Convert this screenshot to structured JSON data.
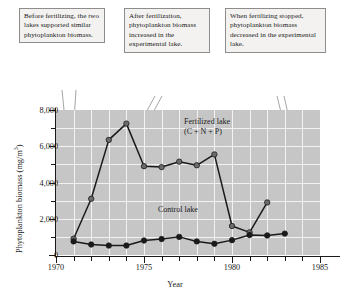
{
  "figure": {
    "callouts": [
      {
        "id": "callout-before",
        "text": "Before fertilizing, the two lakes supported similar phytoplankton biomass."
      },
      {
        "id": "callout-after",
        "text": "After fertilization, phytoplankton biomass increased in the experimental lake."
      },
      {
        "id": "callout-stopped",
        "text": "When fertilizing stopped, phytoplankton biomass decreased in the experimental lake."
      }
    ],
    "colors": {
      "plot_background": "#c6c6c6",
      "gridline": "#f2f2f2",
      "axis": "#1a1a1a",
      "fertilized_marker": "#6b6b6b",
      "control_marker": "#1a1a1a",
      "callout_background": "#f3f2f0",
      "callout_border": "#8d8d8d",
      "leader_line": "#8d8d8d"
    }
  },
  "chart_data": {
    "type": "line",
    "title": "",
    "xlabel": "Year",
    "ylabel": "Phytoplankton biomass (mg/m3)",
    "ylabel_parts": {
      "text": "Phytoplankton biomass (mg/m",
      "superscript": "3",
      "tail": ")"
    },
    "xlim": [
      1970,
      1985
    ],
    "ylim": [
      0,
      8000
    ],
    "grid": true,
    "legend_position": "inline-annotations",
    "x_major_ticks": [
      1970,
      1975,
      1980,
      1985
    ],
    "x_major_tick_labels": [
      "1970",
      "1975",
      "1980",
      "1985"
    ],
    "x_minor_ticks": [
      1971,
      1972,
      1973,
      1974,
      1976,
      1977,
      1978,
      1979,
      1981,
      1982,
      1983,
      1984
    ],
    "y_major_ticks": [
      0,
      2000,
      4000,
      6000,
      8000
    ],
    "y_major_tick_labels": [
      "0",
      "2,000",
      "4,000",
      "6,000",
      "8,000"
    ],
    "y_minor_ticks": [
      1000,
      3000,
      5000,
      7000
    ],
    "x": [
      1971,
      1972,
      1973,
      1974,
      1975,
      1976,
      1977,
      1978,
      1979,
      1980,
      1981,
      1982,
      1983
    ],
    "series": [
      {
        "name": "Fertilized lake (C + N + P)",
        "label_line1": "Fertilized lake",
        "label_line2": "(C + N + P)",
        "marker": "circle",
        "color": "#6b6b6b",
        "values": [
          900,
          3100,
          6350,
          7250,
          4900,
          4850,
          5150,
          4950,
          5550,
          1600,
          1250,
          2900,
          null
        ],
        "values_by_year": {
          "1971": 900,
          "1972": 3100,
          "1973": 6350,
          "1974": 7250,
          "1975": 4900,
          "1976": 4850,
          "1977": 5150,
          "1978": 4950,
          "1979": 5550,
          "1980": 1600,
          "1981": 1250,
          "1982": 2900
        }
      },
      {
        "name": "Control lake",
        "label_line1": "Control lake",
        "marker": "circle",
        "color": "#1a1a1a",
        "values": [
          750,
          580,
          520,
          520,
          800,
          880,
          1000,
          750,
          620,
          820,
          1100,
          1080,
          1180
        ],
        "values_by_year": {
          "1971": 750,
          "1972": 580,
          "1973": 520,
          "1974": 520,
          "1975": 800,
          "1976": 880,
          "1977": 1000,
          "1978": 750,
          "1979": 620,
          "1980": 820,
          "1981": 1100,
          "1982": 1080,
          "1983": 1180
        }
      }
    ]
  }
}
